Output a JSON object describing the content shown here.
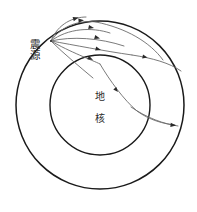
{
  "figure": {
    "kind": "seismic-ray-path-diagram",
    "background_color": "#ffffff",
    "width": 197,
    "height": 212
  },
  "labels": {
    "hypocenter": "震源",
    "core_line1": "地",
    "core_line2": "核"
  },
  "colors": {
    "outer_circle_stroke": "#1a1a1a",
    "inner_circle_stroke": "#1a1a1a",
    "ray_stroke": "#6b6b6b",
    "ray_stroke_dark": "#3a3a3a",
    "arrow_fill": "#2a2a2a",
    "text_fill": "#2b2b2b"
  },
  "geometry": {
    "earth_surface": {
      "cx": 100,
      "cy": 105,
      "r": 84,
      "stroke_width": 1.5
    },
    "core_boundary": {
      "cx": 100,
      "cy": 105,
      "r": 50,
      "stroke_width": 1.4
    },
    "hypocenter_point": {
      "x": 51,
      "y": 41
    }
  },
  "rays": [
    {
      "id": "ray-1",
      "d": "M 51 41 C 58 23 74 17 86 17",
      "arrow_at": [
        78.5,
        17.6
      ],
      "arrow_angle": -22
    },
    {
      "id": "ray-2",
      "d": "M 51 41 C 62 25 80 20 96 22",
      "arrow_at": [
        83,
        20.2
      ],
      "arrow_angle": -8
    },
    {
      "id": "ray-3",
      "d": "M 51 41 C 68 28 92 27 110 33",
      "arrow_at": [
        93,
        27.8
      ],
      "arrow_angle": 10
    },
    {
      "id": "ray-4",
      "d": "M 51 41 C 72 36 100 38 124 46",
      "arrow_at": [
        99,
        38.2
      ],
      "arrow_angle": 14
    },
    {
      "id": "ray-5",
      "d": "M 51 41 C 74 45 104 51 132 55",
      "arrow_at": [
        100,
        49.6
      ],
      "arrow_angle": 16
    },
    {
      "id": "ray-6",
      "d": "M 51 41 C 70 52 92 60 100 64",
      "arrow_at": [
        93.5,
        60.6
      ],
      "arrow_angle": 27
    },
    {
      "id": "ray-7",
      "d": "M 51 41 C 66 56 82 68 96 80",
      "arrow_at": [
        null,
        null
      ],
      "arrow_angle": 0
    },
    {
      "id": "ray-8",
      "d": "M 96 22 C 126 28 150 42 164 62",
      "arrow_at": [
        null,
        null
      ],
      "arrow_angle": 0
    },
    {
      "id": "ray-9",
      "d": "M 132 55 C 152 58 170 64 180 72",
      "arrow_at": [
        147.5,
        57.8
      ],
      "arrow_angle": 12
    },
    {
      "id": "ray-10-core-refracted",
      "d": "M 100 64 C 110 80 124 100 138 112 C 150 120 164 124 175 125",
      "arrow_at": [
        117.5,
        91.5
      ],
      "arrow_angle": 48
    },
    {
      "id": "ray-11-core-exit",
      "d": "M 138 112 C 152 120 166 124 178 125",
      "arrow_at": [
        172,
        124.8
      ],
      "arrow_angle": 6
    }
  ],
  "label_positions": {
    "hypocenter": {
      "x": 30,
      "y": 48
    },
    "core_line1": {
      "x": 93,
      "y": 99
    },
    "core_line2": {
      "x": 93,
      "y": 120
    }
  }
}
